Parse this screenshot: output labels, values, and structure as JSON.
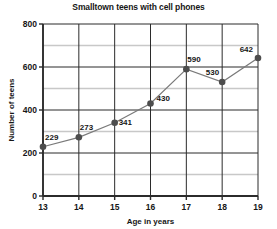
{
  "chart_data": {
    "type": "line",
    "title": "Smalltown teens with cell phones",
    "xlabel": "Age in years",
    "ylabel": "Number of teens",
    "x": [
      13,
      14,
      15,
      16,
      17,
      18,
      19
    ],
    "values": [
      229,
      273,
      341,
      430,
      590,
      530,
      642
    ],
    "point_labels": [
      "229",
      "273",
      "341",
      "430",
      "590",
      "530",
      "642"
    ],
    "xlim": [
      13,
      19
    ],
    "ylim": [
      0,
      800
    ],
    "xticks": [
      "13",
      "14",
      "15",
      "16",
      "17",
      "18",
      "19"
    ],
    "yticks": [
      "0",
      "200",
      "400",
      "600",
      "800"
    ],
    "ytick_values": [
      0,
      200,
      400,
      600,
      800
    ],
    "minor_gridline_values": [
      100,
      300,
      500,
      700
    ],
    "grid": true,
    "legend": "none",
    "series": [
      {
        "name": "Number of teens",
        "values": [
          229,
          273,
          341,
          430,
          590,
          530,
          642
        ]
      }
    ],
    "colors": {
      "background": "#ffffff",
      "line": "#7a7a7a",
      "marker": "#4d4d4d",
      "major_grid": "#2b2b2b",
      "minor_grid": "#c8c8c8",
      "text": "#161616"
    }
  }
}
